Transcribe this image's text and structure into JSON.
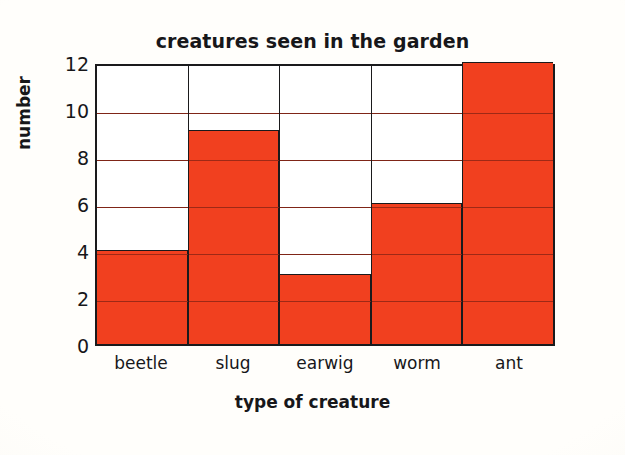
{
  "chart_data": {
    "type": "bar",
    "title": "creatures seen in the garden",
    "xlabel": "type of creature",
    "ylabel": "number",
    "categories": [
      "beetle",
      "slug",
      "earwig",
      "worm",
      "ant"
    ],
    "values": [
      4,
      9,
      3,
      6,
      12
    ],
    "yticks": [
      12,
      10,
      8,
      6,
      4,
      2,
      0
    ],
    "ylim": [
      0,
      12
    ],
    "grid": true,
    "legend": "none",
    "bar_color": "#f1401f",
    "axis_color": "#1a1a1c",
    "background_color": "#fdfcf8"
  }
}
